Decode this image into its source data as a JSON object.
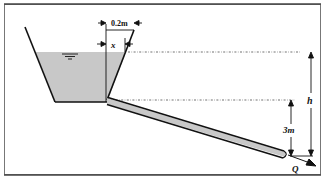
{
  "diagram": {
    "type": "fluid-mechanics-tank-pipe",
    "labels": {
      "top_width": "0.2m",
      "x": "x",
      "h": "h",
      "pipe_drop": "3m",
      "flow": "Q"
    },
    "colors": {
      "water": "#c8c8c8",
      "pipe_fill": "#c8c8c8",
      "line": "#111111",
      "frame": "#555555",
      "background": "#ffffff"
    }
  }
}
